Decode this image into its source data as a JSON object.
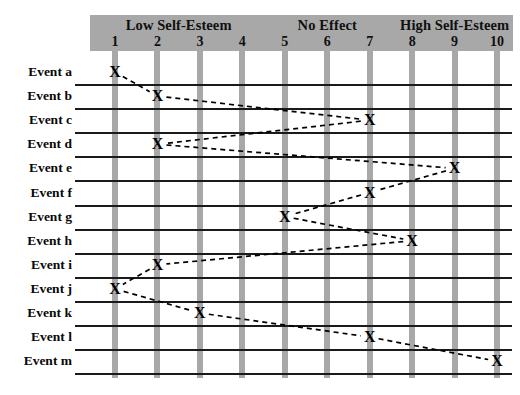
{
  "chart_data": {
    "type": "scatter",
    "title": "",
    "xlabel": "",
    "ylabel": "",
    "xlim": [
      1,
      10
    ],
    "grid": true,
    "legend": "none",
    "x_tick_labels": [
      "1",
      "2",
      "3",
      "4",
      "5",
      "6",
      "7",
      "8",
      "9",
      "10"
    ],
    "zone_labels": [
      {
        "label": "Low Self-Esteem",
        "from": 1,
        "to": 4
      },
      {
        "label": "No Effect",
        "from": 5,
        "to": 7
      },
      {
        "label": "High Self-Esteem",
        "from": 8,
        "to": 10
      }
    ],
    "categories": [
      "Event a",
      "Event b",
      "Event c",
      "Event d",
      "Event e",
      "Event f",
      "Event g",
      "Event h",
      "Event i",
      "Event j",
      "Event k",
      "Event l",
      "Event m"
    ],
    "values": [
      1,
      2,
      7,
      2,
      9,
      7,
      5,
      8,
      2,
      1,
      3,
      7,
      10
    ],
    "marker": "X",
    "connector": "dashed",
    "colors": {
      "band": "#a8a8a8",
      "column_bar": "#a8a8a8",
      "rule": "#1a1a1a",
      "marker": "#000000",
      "background": "#ffffff"
    }
  },
  "axis": {
    "numbers": [
      "1",
      "2",
      "3",
      "4",
      "5",
      "6",
      "7",
      "8",
      "9",
      "10"
    ]
  },
  "bands": {
    "low": "Low Self-Esteem",
    "none": "No Effect",
    "high": "High Self-Esteem"
  },
  "rows": [
    {
      "label": "Event a",
      "value": 1
    },
    {
      "label": "Event b",
      "value": 2
    },
    {
      "label": "Event c",
      "value": 7
    },
    {
      "label": "Event d",
      "value": 2
    },
    {
      "label": "Event e",
      "value": 9
    },
    {
      "label": "Event f",
      "value": 7
    },
    {
      "label": "Event g",
      "value": 5
    },
    {
      "label": "Event h",
      "value": 8
    },
    {
      "label": "Event i",
      "value": 2
    },
    {
      "label": "Event j",
      "value": 1
    },
    {
      "label": "Event k",
      "value": 3
    },
    {
      "label": "Event l",
      "value": 7
    },
    {
      "label": "Event m",
      "value": 10
    }
  ],
  "marker_glyph": "X"
}
